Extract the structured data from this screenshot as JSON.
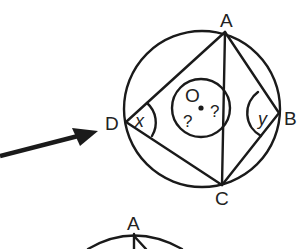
{
  "diagram": {
    "type": "circle-geometry",
    "colors": {
      "stroke": "#1a1a1a",
      "text": "#222222",
      "background": "#ffffff"
    },
    "points": {
      "A": {
        "label": "A"
      },
      "B": {
        "label": "B"
      },
      "C": {
        "label": "C"
      },
      "D": {
        "label": "D"
      },
      "O": {
        "label": "O"
      }
    },
    "angles": {
      "at_D": "x",
      "at_B": "y",
      "at_O_left": "?",
      "at_O_right": "?"
    },
    "second_figure": {
      "top_label": "A"
    },
    "arrow": {
      "direction": "pointing-to-D"
    }
  }
}
